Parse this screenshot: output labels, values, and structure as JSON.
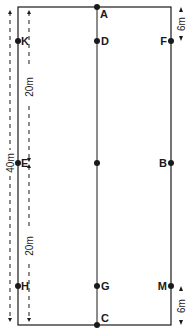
{
  "diagram": {
    "type": "dressage-arena",
    "colors": {
      "line": "#1a1a1a",
      "background": "#ffffff"
    },
    "markers": {
      "A": "A",
      "K": "K",
      "D": "D",
      "F": "F",
      "E": "E",
      "X": "",
      "B": "B",
      "H": "H",
      "G": "G",
      "M": "M",
      "C": "C"
    },
    "dimensions": {
      "total_length": "40m",
      "half_length_top": "20m",
      "half_length_bottom": "20m",
      "corner_offset_top": "6m",
      "corner_offset_bottom": "6m"
    }
  }
}
